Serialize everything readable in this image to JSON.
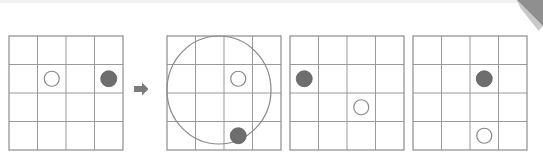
{
  "figure": {
    "width": 543,
    "height": 160,
    "background_color": "#ffffff",
    "top_band_color": "#f1f1f1"
  },
  "style": {
    "grid_line_color": "#9a9a9a",
    "grid_outer_color": "#8c8c8c",
    "filled_token_color": "#6e6e6e",
    "filled_token_stroke": "#5f5f5f",
    "open_token_stroke": "#8a8a8a",
    "open_token_fill": "#ffffff",
    "lasso_stroke_color": "#8a8a8a",
    "arrow_color": "#7c7c7c",
    "curl_color": "#8f8f8f",
    "curl_shadow_color": "#c9c9c9"
  },
  "grid": {
    "rows": 4,
    "cols": 4,
    "cell_size": 28.5
  },
  "panels": [
    {
      "id": "panel-1",
      "name": "initial-state",
      "x": 8,
      "y": 35,
      "tokens": [
        {
          "name": "open-token",
          "type": "open",
          "row": 2,
          "col": 2
        },
        {
          "name": "filled-token",
          "type": "filled",
          "row": 2,
          "col": 4
        }
      ],
      "lasso": null
    },
    {
      "id": "panel-2",
      "name": "lasso-gesture-state",
      "x": 166,
      "y": 35,
      "tokens": [
        {
          "name": "open-token",
          "type": "open",
          "row": 2,
          "col": 3
        },
        {
          "name": "filled-token",
          "type": "filled",
          "row": 4,
          "col": 3
        }
      ],
      "lasso": {
        "name": "lasso-circle-stroke",
        "cx": 52,
        "cy": 54,
        "rx": 52,
        "ry": 54
      }
    },
    {
      "id": "panel-3",
      "name": "result-state-a",
      "x": 289,
      "y": 35,
      "tokens": [
        {
          "name": "filled-token",
          "type": "filled",
          "row": 2,
          "col": 1
        },
        {
          "name": "open-token",
          "type": "open",
          "row": 3,
          "col": 3
        }
      ],
      "lasso": null
    },
    {
      "id": "panel-4",
      "name": "result-state-b",
      "x": 412,
      "y": 35,
      "tokens": [
        {
          "name": "filled-token",
          "type": "filled",
          "row": 2,
          "col": 3
        },
        {
          "name": "open-token",
          "type": "open",
          "row": 4,
          "col": 3
        }
      ],
      "lasso": null
    }
  ],
  "arrow": {
    "name": "right-arrow-icon",
    "x": 134,
    "y": 82,
    "width": 15,
    "height": 14,
    "direction": "right"
  },
  "page_curl": {
    "name": "page-curl-icon",
    "x": 511,
    "y": 0,
    "size": 32
  }
}
